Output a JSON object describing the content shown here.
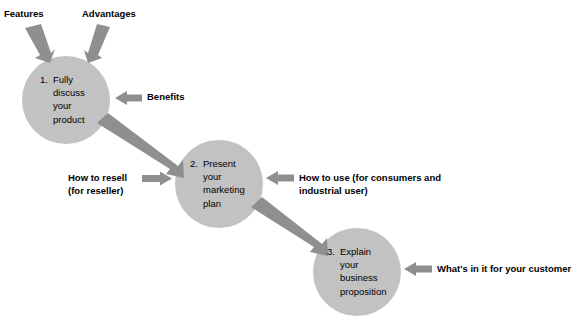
{
  "diagram": {
    "type": "process-flow",
    "colors": {
      "circle_fill": "#c2c2c2",
      "arrow_fill": "#8f8f8f",
      "text": "#000000",
      "background": "#ffffff"
    },
    "steps": [
      {
        "number": "1.",
        "lines": [
          "Fully",
          "discuss",
          "your",
          "product"
        ],
        "text": "1. Fully discuss your product"
      },
      {
        "number": "2.",
        "lines": [
          "Present",
          "your",
          "marketing",
          "plan"
        ],
        "text": "2. Present your marketing plan"
      },
      {
        "number": "3.",
        "lines": [
          "Explain",
          "your",
          "business",
          "proposition"
        ],
        "text": "3. Explain your business proposition"
      }
    ],
    "callouts": [
      {
        "id": "features",
        "lines": [
          "Features"
        ],
        "target_step": 1,
        "direction": "down-right"
      },
      {
        "id": "advantages",
        "lines": [
          "Advantages"
        ],
        "target_step": 1,
        "direction": "down-left"
      },
      {
        "id": "benefits",
        "lines": [
          "Benefits"
        ],
        "target_step": 1,
        "direction": "left"
      },
      {
        "id": "how-to-resell",
        "lines": [
          "How to resell",
          "(for reseller)"
        ],
        "target_step": 2,
        "direction": "right"
      },
      {
        "id": "how-to-use",
        "lines": [
          "How to use (for consumers and",
          "industrial user)"
        ],
        "target_step": 2,
        "direction": "left"
      },
      {
        "id": "whats-in-it",
        "lines": [
          "What's in it for your customer"
        ],
        "target_step": 3,
        "direction": "left"
      }
    ],
    "connectors": [
      {
        "from": 1,
        "to": 2
      },
      {
        "from": 2,
        "to": 3
      }
    ]
  }
}
